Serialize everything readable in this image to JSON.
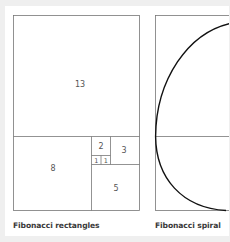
{
  "diagrams": [
    {
      "caption": "Fibonacci rectangles",
      "squares": [
        {
          "label": "13"
        },
        {
          "label": "8"
        },
        {
          "label": "5"
        },
        {
          "label": "3"
        },
        {
          "label": "2"
        },
        {
          "label": "1"
        },
        {
          "label": "1"
        }
      ]
    },
    {
      "caption": "Fibonacci spiral"
    }
  ],
  "colors": {
    "background": "#efefef",
    "panel": "#ffffff",
    "line": "#777777",
    "spiral": "#111111",
    "text": "#555555",
    "caption": "#3a3a3a"
  }
}
